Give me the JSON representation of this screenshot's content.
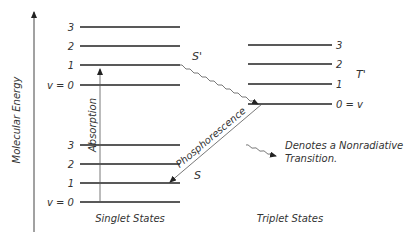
{
  "diagram": {
    "axis_label": "Molecular Energy",
    "singlet": {
      "title": "Singlet States",
      "upper_label": "S'",
      "lower_label": "S",
      "upper_levels": [
        "3",
        "2",
        "1",
        "v = 0"
      ],
      "lower_levels": [
        "3",
        "2",
        "1",
        "v = 0"
      ]
    },
    "triplet": {
      "title": "Triplet States",
      "label": "T'",
      "levels": [
        "3",
        "2",
        "1",
        "0 = v"
      ]
    },
    "transitions": {
      "absorption": "Absorption",
      "phosphorescence": "Phosphorescence"
    },
    "legend": {
      "line1": "Denotes a Nonradiative",
      "line2": "Transition."
    },
    "colors": {
      "line": "#222222",
      "text": "#333333",
      "background": "#ffffff"
    }
  }
}
